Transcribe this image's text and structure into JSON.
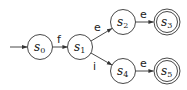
{
  "diagram": {
    "type": "finite-state-automaton",
    "start_state": "s0",
    "states": [
      {
        "id": "s0",
        "base": "s",
        "sub": "0",
        "cx": 40,
        "cy": 47,
        "accepting": false
      },
      {
        "id": "s1",
        "base": "s",
        "sub": "1",
        "cx": 80,
        "cy": 47,
        "accepting": false
      },
      {
        "id": "s2",
        "base": "s",
        "sub": "2",
        "cx": 123,
        "cy": 22,
        "accepting": false
      },
      {
        "id": "s3",
        "base": "s",
        "sub": "3",
        "cx": 167,
        "cy": 22,
        "accepting": true
      },
      {
        "id": "s4",
        "base": "s",
        "sub": "4",
        "cx": 123,
        "cy": 71,
        "accepting": false
      },
      {
        "id": "s5",
        "base": "s",
        "sub": "5",
        "cx": 167,
        "cy": 71,
        "accepting": true
      }
    ],
    "transitions": [
      {
        "from": "s0",
        "to": "s1",
        "label": "f"
      },
      {
        "from": "s1",
        "to": "s2",
        "label": "e"
      },
      {
        "from": "s2",
        "to": "s3",
        "label": "e"
      },
      {
        "from": "s1",
        "to": "s4",
        "label": "i"
      },
      {
        "from": "s4",
        "to": "s5",
        "label": "e"
      }
    ]
  }
}
